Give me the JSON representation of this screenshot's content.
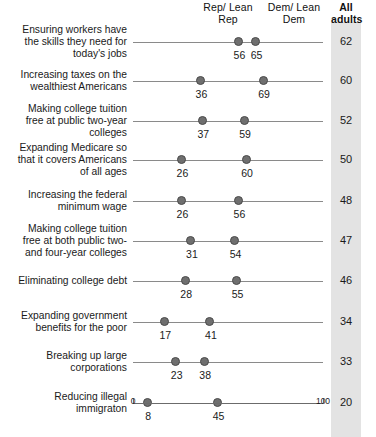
{
  "header": {
    "col_rep": "Rep/\nLean Rep",
    "col_dem": "Dem/\nLean Dem",
    "col_all": "All\nadults"
  },
  "axis": {
    "min_label": "0",
    "max_label": "100",
    "min": 0,
    "max": 100
  },
  "chart_data": {
    "type": "scatter",
    "subtype": "dumbbell-dot-plot",
    "title": "",
    "xlabel": "",
    "ylabel": "",
    "xlim": [
      0,
      100
    ],
    "grid": false,
    "legend_position": "top",
    "series": [
      {
        "name": "Rep/Lean Rep",
        "values": [
          56,
          36,
          37,
          26,
          26,
          31,
          28,
          17,
          23,
          8
        ]
      },
      {
        "name": "Dem/Lean Dem",
        "values": [
          65,
          69,
          59,
          60,
          56,
          54,
          55,
          41,
          38,
          45
        ]
      },
      {
        "name": "All adults",
        "values": [
          62,
          60,
          52,
          50,
          48,
          47,
          46,
          34,
          33,
          20
        ]
      }
    ],
    "categories": [
      "Ensuring workers have the skills they need for today's jobs",
      "Increasing taxes on the wealthiest Americans",
      "Making college tuition free at public two-year colleges",
      "Expanding Medicare so that it covers Americans of all ages",
      "Increasing the federal minimum wage",
      "Making college tuition free at both public two- and four-year colleges",
      "Eliminating college debt",
      "Expanding government benefits for the poor",
      "Breaking up large corporations",
      "Reducing illegal immigraton"
    ]
  },
  "rows": [
    {
      "label": "Ensuring workers have\nthe skills they need for\ntoday's jobs",
      "rep": 56,
      "dem": 65,
      "all": 62,
      "rep_text": "56",
      "dem_text": "65",
      "all_text": "62"
    },
    {
      "label": "Increasing taxes on the\nwealthiest Americans",
      "rep": 36,
      "dem": 69,
      "all": 60,
      "rep_text": "36",
      "dem_text": "69",
      "all_text": "60"
    },
    {
      "label": "Making college tuition\nfree at public two-year\ncolleges",
      "rep": 37,
      "dem": 59,
      "all": 52,
      "rep_text": "37",
      "dem_text": "59",
      "all_text": "52"
    },
    {
      "label": "Expanding Medicare so\nthat it covers Americans\nof all ages",
      "rep": 26,
      "dem": 60,
      "all": 50,
      "rep_text": "26",
      "dem_text": "60",
      "all_text": "50"
    },
    {
      "label": "Increasing the federal\nminimum wage",
      "rep": 26,
      "dem": 56,
      "all": 48,
      "rep_text": "26",
      "dem_text": "56",
      "all_text": "48"
    },
    {
      "label": "Making college tuition\nfree at both public two-\nand four-year colleges",
      "rep": 31,
      "dem": 54,
      "all": 47,
      "rep_text": "31",
      "dem_text": "54",
      "all_text": "47"
    },
    {
      "label": "Eliminating college debt",
      "rep": 28,
      "dem": 55,
      "all": 46,
      "rep_text": "28",
      "dem_text": "55",
      "all_text": "46"
    },
    {
      "label": "Expanding government\nbenefits for the poor",
      "rep": 17,
      "dem": 41,
      "all": 34,
      "rep_text": "17",
      "dem_text": "41",
      "all_text": "34"
    },
    {
      "label": "Breaking up large\ncorporations",
      "rep": 23,
      "dem": 38,
      "all": 33,
      "rep_text": "23",
      "dem_text": "38",
      "all_text": "33"
    },
    {
      "label": "Reducing illegal\nimmigraton",
      "rep": 8,
      "dem": 45,
      "all": 20,
      "rep_text": "8",
      "dem_text": "45",
      "all_text": "20"
    }
  ],
  "colors": {
    "dot": "#6f6f6f",
    "dot_edge": "#4a4a4a",
    "row_line": "#8a8a8a",
    "band": "#e3e3e3",
    "text": "#1a1a1a"
  }
}
